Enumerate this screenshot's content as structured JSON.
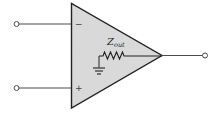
{
  "diagram": {
    "type": "op-amp output impedance model",
    "colors": {
      "triangle_fill": "#d9d9d9",
      "stroke": "#222222",
      "wire": "#4a4a4a",
      "background": "#ffffff"
    },
    "inputs": {
      "inverting": {
        "symbol": "−"
      },
      "non_inverting": {
        "symbol": "+"
      }
    },
    "internal": {
      "resistor_label_main": "Z",
      "resistor_label_sub": "out",
      "ground": "ground-symbol"
    },
    "output": {
      "terminal": "output"
    }
  }
}
